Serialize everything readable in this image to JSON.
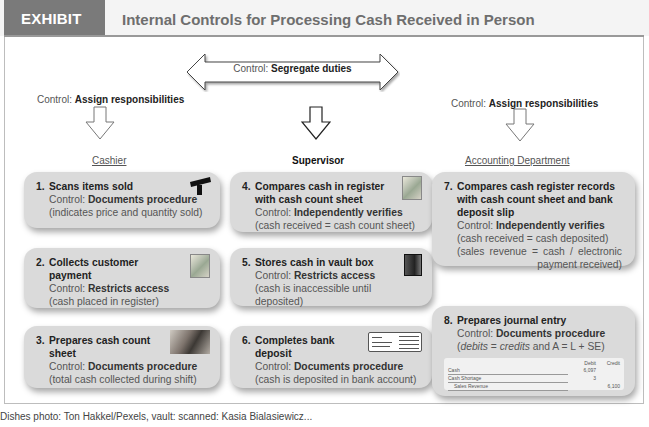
{
  "header": {
    "exhibit_label": "EXHIBIT 5.6",
    "title": "Internal Controls for Processing Cash Received in Person"
  },
  "control_prefix": "Control: ",
  "segregate": {
    "label": "Segregate duties"
  },
  "assign_left": {
    "label": "Assign responsibilities"
  },
  "assign_right": {
    "label": "Assign responsibilities"
  },
  "columns": {
    "cashier": "Cashier",
    "supervisor": "Supervisor",
    "accounting": "Accounting Department"
  },
  "steps": [
    {
      "num": "1.",
      "title": "Scans items sold",
      "control": "Documents procedure",
      "note": "(indicates price and quantity sold)",
      "icon": "barcode-scanner-icon"
    },
    {
      "num": "2.",
      "title": "Collects customer payment",
      "control": "Restricts access",
      "note": "(cash placed in register)",
      "icon": "cash-icon"
    },
    {
      "num": "3.",
      "title": "Prepares cash count sheet",
      "control": "Documents procedure",
      "note": "(total cash collected during shift)",
      "icon": "counting-cash-icon"
    },
    {
      "num": "4.",
      "title": "Compares cash in register with cash count sheet",
      "control": "Independently verifies",
      "note": "(cash received = cash count sheet)",
      "icon": "cash-icon"
    },
    {
      "num": "5.",
      "title": "Stores cash in vault box",
      "control": "Restricts access",
      "note": "(cash is inaccessible until deposited)",
      "icon": "vault-icon"
    },
    {
      "num": "6.",
      "title": "Completes bank deposit",
      "control": "Documents procedure",
      "note": "(cash is deposited in bank account)",
      "icon": "deposit-slip-icon"
    },
    {
      "num": "7.",
      "title": "Compares cash register records with cash count sheet and bank deposit slip",
      "control": "Independently verifies",
      "note": "(cash received = cash deposited)",
      "note2": "(sales revenue = cash / electronic payment received)"
    },
    {
      "num": "8.",
      "title": "Prepares journal entry",
      "control": "Documents procedure",
      "note_parts": {
        "debits": "debits",
        "eq1": " = ",
        "credits": "credits",
        "rest": " and A = L + SE)"
      }
    }
  ],
  "journal": {
    "headers": {
      "debit": "Debit",
      "credit": "Credit"
    },
    "rows": [
      {
        "account": "Cash",
        "debit": "6,097",
        "credit": ""
      },
      {
        "account": "Cash Shortage",
        "debit": "3",
        "credit": ""
      },
      {
        "account": "Sales Revenue",
        "debit": "",
        "credit": "6,100"
      }
    ]
  },
  "footer": {
    "text": "Dishes photo: Ton Hakkel/Pexels, vault: scanned: Kasia Bialasiewicz..."
  },
  "colors": {
    "exhibit_tag_bg": "#7a7a7a",
    "box_bg": "#dadada",
    "header_bg": "#f4f4f4"
  }
}
